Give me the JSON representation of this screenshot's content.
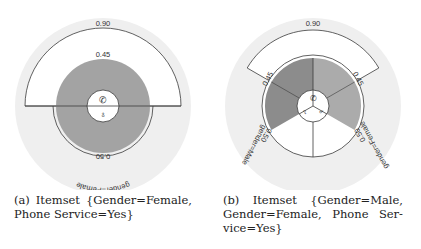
{
  "panels": [
    {
      "id": "a",
      "top_label": "PhoneService=Yes",
      "outer_value": "0.90",
      "inner_top_value": "0.45",
      "bottom_value": "0.50",
      "bottom_label": "gender=Female",
      "caption_lines": [
        [
          "(a)",
          "Itemset",
          "{Gender=Female,"
        ],
        [
          "Phone Service=Yes}"
        ]
      ]
    },
    {
      "id": "b",
      "top_label": "PhoneService=Yes",
      "outer_value": "0.90",
      "left_inner_value": "0.45",
      "right_inner_value": "0.45",
      "left_value": "0.50",
      "left_label": "gender=Male",
      "right_value": "0.50",
      "right_label": "gender=Female",
      "caption_lines": [
        [
          "(b)",
          "Itemset",
          "{Gender=Male,"
        ],
        [
          "Gender=Female,",
          "Phone",
          "Ser-"
        ],
        [
          "vice=Yes}"
        ]
      ]
    }
  ],
  "colors": {
    "background_disc": "#efefef",
    "panel_a_overlap": "#a3a3a3",
    "panel_b_left_overlap": "#8c8c8c",
    "panel_b_right_overlap": "#ababab",
    "stroke": "#3a3a3a"
  },
  "icons": {
    "phone": "phone-icon",
    "female": "female-icon",
    "male": "male-icon"
  }
}
